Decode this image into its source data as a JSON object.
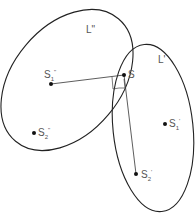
{
  "diagram": {
    "curves": [
      {
        "id": "L_double_prime",
        "label": "L\"",
        "cx": 67,
        "cy": 80,
        "rx": 58,
        "ry": 78,
        "rotate": 40
      },
      {
        "id": "L_prime",
        "label": "L'",
        "cx": 153,
        "cy": 128,
        "rx": 40,
        "ry": 84,
        "rotate": -6
      }
    ],
    "points": [
      {
        "id": "S",
        "label": "S",
        "x": 124,
        "y": 75
      },
      {
        "id": "S1_double_prime",
        "label": "S₁\"",
        "x": 51,
        "y": 84
      },
      {
        "id": "S2_double_prime",
        "label": "S₂\"",
        "x": 34,
        "y": 133
      },
      {
        "id": "S1_prime",
        "label": "S₁'",
        "x": 165,
        "y": 124
      },
      {
        "id": "S2_prime",
        "label": "S₂'",
        "x": 136,
        "y": 174
      }
    ],
    "segments": [
      {
        "from": "S1_double_prime",
        "to": "S"
      },
      {
        "from": "S",
        "to": "S2_prime"
      }
    ],
    "right_angle_markers": 2
  },
  "labels": {
    "L_double_prime": "L\"",
    "L_prime": "L'",
    "S": "S",
    "S1_double_prime_base": "S",
    "S1_double_prime_sub": "1",
    "S1_double_prime_sup": "\"",
    "S2_double_prime_base": "S",
    "S2_double_prime_sub": "2",
    "S2_double_prime_sup": "\"",
    "S1_prime_base": "S",
    "S1_prime_sub": "1",
    "S1_prime_sup": "'",
    "S2_prime_base": "S",
    "S2_prime_sub": "2",
    "S2_prime_sup": "'"
  }
}
